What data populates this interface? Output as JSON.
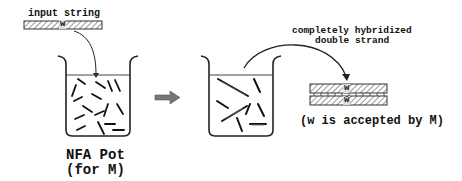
{
  "diagram": {
    "input": {
      "label": "input string",
      "strand_label": "w"
    },
    "pot": {
      "title_line1": "NFA Pot",
      "title_line2": "(for M)"
    },
    "transition_arrow": "right-block-arrow",
    "result": {
      "label_line1": "completely hybridized",
      "label_line2": "double strand",
      "top_strand_label": "w",
      "bottom_strand_label": "w̄",
      "conclusion": "(w is accepted by M)"
    }
  }
}
